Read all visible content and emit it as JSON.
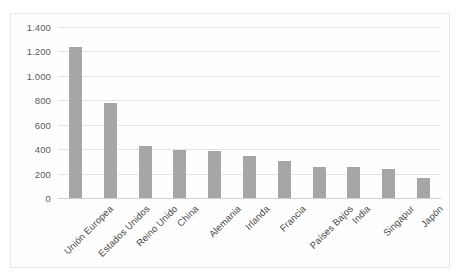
{
  "chart_data": {
    "type": "bar",
    "title": "",
    "subtitle": "",
    "xlabel": "",
    "ylabel": "",
    "ylim": [
      0,
      1400
    ],
    "ytick_step": 200,
    "yticks": [
      "0",
      "200",
      "400",
      "600",
      "800",
      "1.000",
      "1.200",
      "1.400"
    ],
    "grid": true,
    "legend": "none",
    "bar_color": "#a6a6a6",
    "gridline_color": "#e4e4e4",
    "axis_color": "#d2d2d2",
    "categories": [
      "Unión Europea",
      "Estados Unidos",
      "Reino Unido",
      "China",
      "Alemania",
      "Irlanda",
      "Francia",
      "Países Bajos",
      "India",
      "Singapur",
      "Japón"
    ],
    "values": [
      1235,
      775,
      425,
      395,
      385,
      345,
      305,
      255,
      250,
      240,
      165
    ],
    "series": [
      {
        "name": "",
        "values": [
          1235,
          775,
          425,
          395,
          385,
          345,
          305,
          255,
          250,
          240,
          165
        ]
      }
    ]
  }
}
